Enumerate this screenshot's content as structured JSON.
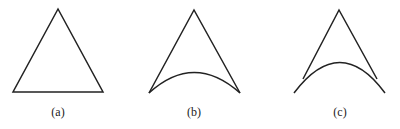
{
  "figure": {
    "panels": [
      {
        "id": "a",
        "label": "(a)",
        "shape": "triangle with straight base"
      },
      {
        "id": "b",
        "label": "(b)",
        "shape": "triangle with base arc meeting at corners"
      },
      {
        "id": "c",
        "label": "(c)",
        "shape": "triangle with arc crossing sides"
      }
    ],
    "stroke_color": "#222222"
  }
}
